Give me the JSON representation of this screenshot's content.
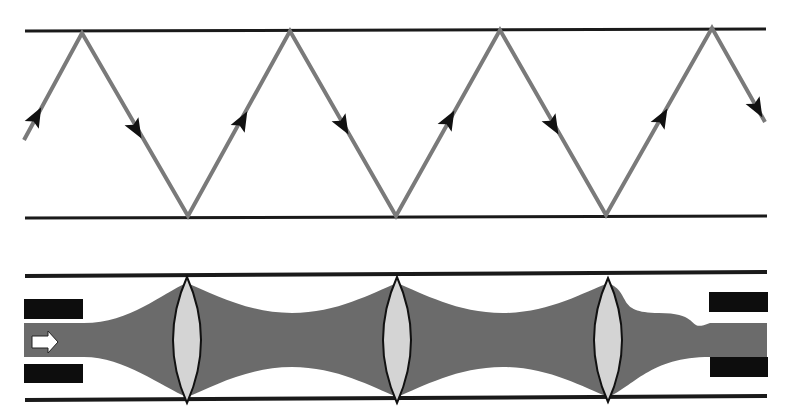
{
  "colors": {
    "background": "#ffffff",
    "mirror": "#1a1a1a",
    "ray": "#7a7a7a",
    "arrowhead": "#111111",
    "beam": "#6b6b6b",
    "lens_fill": "#d4d4d4",
    "lens_stroke": "#111111",
    "aperture_block": "#0d0d0d",
    "input_arrow_fill": "#ffffff"
  },
  "ray_panel": {
    "label": "Ray bouncing between parallel mirrors",
    "mirror_top": {
      "x1": 25,
      "x2": 766,
      "y": 31
    },
    "mirror_bottom": {
      "x1": 25,
      "x2": 767,
      "y": 217
    },
    "ray_points": [
      [
        24,
        140
      ],
      [
        82,
        33
      ],
      [
        188,
        216
      ],
      [
        290,
        31
      ],
      [
        396,
        216
      ],
      [
        500,
        30
      ],
      [
        606,
        215
      ],
      [
        712,
        28
      ],
      [
        765,
        122
      ]
    ],
    "arrows": [
      {
        "x": 36,
        "y": 117,
        "dir": "up"
      },
      {
        "x": 136,
        "y": 129,
        "dir": "down"
      },
      {
        "x": 242,
        "y": 121,
        "dir": "up"
      },
      {
        "x": 343,
        "y": 125,
        "dir": "down"
      },
      {
        "x": 449,
        "y": 120,
        "dir": "up"
      },
      {
        "x": 553,
        "y": 125,
        "dir": "down"
      },
      {
        "x": 662,
        "y": 118,
        "dir": "up"
      },
      {
        "x": 757,
        "y": 108,
        "dir": "down"
      }
    ]
  },
  "lens_panel": {
    "label": "Lens waveguide with periodic focusing",
    "rail_top": {
      "x1": 25,
      "x2": 767,
      "y": 275
    },
    "rail_bottom": {
      "x1": 25,
      "x2": 767,
      "y": 399
    },
    "axis_y": 340,
    "beam": {
      "x_start": 24,
      "x_end": 767,
      "waist_half_width": 17,
      "lens_half_width": 57,
      "entry_half_width": 17
    },
    "lenses": [
      {
        "cx": 187,
        "half_width": 14,
        "half_height": 63
      },
      {
        "cx": 397,
        "half_width": 14,
        "half_height": 63
      },
      {
        "cx": 608,
        "half_width": 14,
        "half_height": 62
      }
    ],
    "input_blocks": [
      {
        "x": 24,
        "y": 299,
        "w": 59,
        "h": 20
      },
      {
        "x": 24,
        "y": 364,
        "w": 59,
        "h": 19
      }
    ],
    "output_blocks": [
      {
        "x": 709,
        "y": 292,
        "w": 59,
        "h": 20
      },
      {
        "x": 710,
        "y": 357,
        "w": 58,
        "h": 20
      }
    ],
    "input_arrow": {
      "x": 32,
      "y": 331,
      "w": 26,
      "h": 22
    }
  }
}
